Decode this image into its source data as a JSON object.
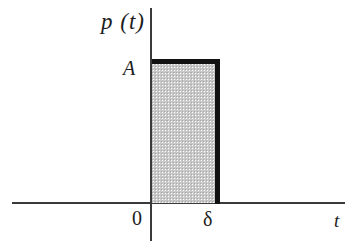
{
  "figure": {
    "title": ""
  },
  "labels": {
    "y_axis": "p (t)",
    "amplitude": "A",
    "origin": "0",
    "pulse_width": "δ",
    "x_axis": "t"
  },
  "colors": {
    "background": "#ffffff",
    "axis": "#3a3a3a",
    "pulse_outline": "#121212",
    "pulse_fill": "#c9c9c9",
    "text": "#1d1d1d"
  },
  "chart_data": {
    "type": "area",
    "title": "",
    "xlabel": "t",
    "ylabel": "p (t)",
    "x": [
      0,
      0,
      1,
      1
    ],
    "values": [
      0,
      1,
      1,
      0
    ],
    "series": [
      {
        "name": "p(t)",
        "values": [
          0,
          1,
          1,
          0
        ]
      }
    ],
    "annotations": [
      {
        "text": "A",
        "axis": "y",
        "value": 1
      },
      {
        "text": "0",
        "axis": "x",
        "value": 0
      },
      {
        "text": "δ",
        "axis": "x",
        "value": 1
      }
    ],
    "tick_labels": {
      "x": [
        "0",
        "δ"
      ],
      "y": [
        "A"
      ]
    },
    "xlim": [
      -0.42,
      3.0
    ],
    "ylim": [
      -0.27,
      1.36
    ],
    "grid": false,
    "legend": false,
    "fill": "stippled-gray"
  }
}
